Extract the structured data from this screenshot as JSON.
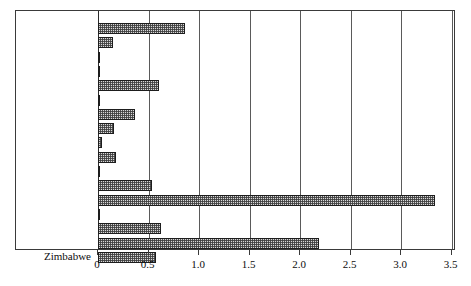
{
  "chart_data": {
    "type": "bar",
    "orientation": "horizontal",
    "title": "",
    "xlabel": "",
    "ylabel": "",
    "xlim": [
      0,
      3.5
    ],
    "xticks": [
      0,
      0.5,
      1.0,
      1.5,
      2.0,
      2.5,
      3.0,
      3.5
    ],
    "xtick_labels": [
      "0",
      "0.5",
      "1.0",
      "1.5",
      "2.0",
      "2.5",
      "3.0",
      "3.5"
    ],
    "grid": true,
    "grid_axis": "x",
    "legend": false,
    "categories": [
      "Albania",
      "Brazil",
      "Cuba",
      "Cyprus",
      "Finland",
      "Greece",
      "India",
      "Iran",
      "Japan",
      "Malagasy Rep.",
      "Pakistan",
      "Philippines",
      "South Africa",
      "Sudan",
      "Turkey",
      "USSR",
      "Zimbabwe"
    ],
    "values": [
      0.86,
      0.15,
      0.02,
      0.01,
      0.6,
      0.01,
      0.37,
      0.16,
      0.04,
      0.18,
      0.01,
      0.53,
      3.34,
      0.01,
      0.62,
      2.19,
      0.57
    ],
    "bar_style": {
      "fill": "#d8d8d8",
      "pattern": "checkerboard-hatch",
      "edge_color": "#1d1d1d"
    }
  }
}
